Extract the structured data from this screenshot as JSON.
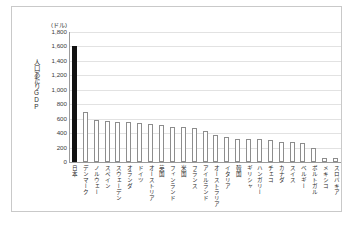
{
  "chart_data": {
    "type": "bar",
    "title": "",
    "xlabel": "",
    "ylabel": "人口あたりGDP",
    "yunit": "(ドル)",
    "ylim": [
      0,
      1800
    ],
    "ytick_labels": [
      "1,800",
      "1,600",
      "1,400",
      "1,200",
      "1,000",
      "800",
      "600",
      "400",
      "200",
      "0"
    ],
    "ytick_values": [
      1800,
      1600,
      1400,
      1200,
      1000,
      800,
      600,
      400,
      200,
      0
    ],
    "grid": true,
    "legend": "none",
    "highlight_index": 0,
    "highlight_color": "#121212",
    "bar_color": "#ffffff",
    "bar_border_color": "#8d8d8d",
    "categories": [
      "日本",
      "デンマーク",
      "ノルウェー",
      "スペイン",
      "スウェーデン",
      "オランダ",
      "ドイツ",
      "オーストリア",
      "英国",
      "フィンランド",
      "米国",
      "フランス",
      "アイルランド",
      "オーストラリア",
      "イタリア",
      "韓国",
      "ギリシャ",
      "ハンガリー",
      "チェコ",
      "カナダ",
      "スイス",
      "ベルギー",
      "ポルトガル",
      "メキシコ",
      "スロバキア"
    ],
    "values": [
      1600,
      690,
      580,
      570,
      560,
      550,
      535,
      520,
      515,
      490,
      480,
      465,
      425,
      370,
      340,
      325,
      320,
      315,
      300,
      280,
      275,
      260,
      195,
      55,
      50
    ]
  }
}
